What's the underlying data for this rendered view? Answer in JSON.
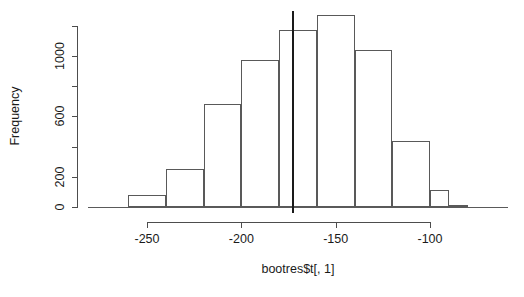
{
  "chart_data": {
    "type": "bar",
    "title": "",
    "subtitle": "",
    "xlabel": "bootres$t[, 1]",
    "ylabel": "Frequency",
    "xlim": [
      -275,
      -80
    ],
    "ylim": [
      0,
      1270
    ],
    "grid": false,
    "legend": null,
    "x_ticks": [
      -250,
      -200,
      -150,
      -100
    ],
    "x_tick_labels": [
      "-250",
      "-200",
      "-150",
      "-100"
    ],
    "y_ticks": [
      0,
      200,
      400,
      600,
      800,
      1000,
      1200
    ],
    "y_tick_labels": [
      "0",
      "200",
      "",
      "600",
      "",
      "1000",
      ""
    ],
    "y_labeled_ticks": [
      0,
      200,
      600,
      1000
    ],
    "bin_width": 20,
    "bin_edges": [
      -260,
      -240,
      -220,
      -200,
      -180,
      -160,
      -140,
      -120,
      -100,
      -90,
      -80
    ],
    "categories": [
      "-260 to -240",
      "-240 to -220",
      "-220 to -200",
      "-200 to -180",
      "-180 to -160",
      "-160 to -140",
      "-140 to -120",
      "-120 to -100",
      "-100 to -90",
      "-90 to -80"
    ],
    "values": [
      80,
      250,
      680,
      975,
      1170,
      1270,
      1040,
      440,
      110,
      15
    ],
    "annotations": [
      {
        "name": "observed-value-line",
        "type": "vertical-line",
        "x": -173,
        "label": ""
      }
    ]
  },
  "axes": {
    "y_title": "Frequency",
    "x_title": "bootres$t[, 1]"
  }
}
